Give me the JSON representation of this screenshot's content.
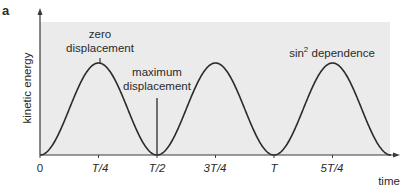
{
  "panel_label": "a",
  "chart_data": {
    "type": "line",
    "title": "",
    "xlabel": "time",
    "ylabel": "kinetic energy",
    "x_ticks": [
      {
        "label": "0",
        "t": 0
      },
      {
        "label": "T/4",
        "t": 0.25
      },
      {
        "label": "T/2",
        "t": 0.5
      },
      {
        "label": "3T/4",
        "t": 0.75
      },
      {
        "label": "T",
        "t": 1.0
      },
      {
        "label": "5T/4",
        "t": 1.25
      }
    ],
    "xlim": [
      0,
      1.5
    ],
    "ylim": [
      0,
      1.3
    ],
    "grid": false,
    "series": [
      {
        "name": "kinetic energy",
        "function": "sin^2(2*pi*t/T)",
        "period": 0.5,
        "amplitude": 1.0
      }
    ],
    "annotations": [
      {
        "text_lines": [
          "zero",
          "displacement"
        ],
        "t": 0.25,
        "points_to": "peak"
      },
      {
        "text_lines": [
          "maximum",
          "displacement"
        ],
        "t": 0.5,
        "points_to": "trough"
      },
      {
        "text": "sin",
        "superscript": "2",
        "text_after": " dependence",
        "t": 1.25
      }
    ],
    "colors": {
      "plot_background": "#ebebeb",
      "curve": "#2b2b2b",
      "axis": "#3a3a3a"
    }
  }
}
